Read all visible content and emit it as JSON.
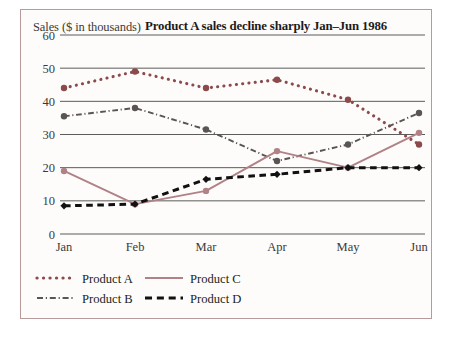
{
  "figure": {
    "yaxis_title": "Sales ($ in thousands)",
    "title": "Product A sales decline sharply Jan–Jun 1986"
  },
  "chart_data": {
    "type": "line",
    "title": "Product A sales decline sharply Jan–Jun 1986",
    "xlabel": "",
    "ylabel": "Sales ($ in thousands)",
    "categories": [
      "Jan",
      "Feb",
      "Mar",
      "Apr",
      "May",
      "Jun"
    ],
    "ylim": [
      0,
      60
    ],
    "yticks": [
      0,
      10,
      20,
      30,
      40,
      50,
      60
    ],
    "ytick_labels": [
      "0",
      "10",
      "20",
      "30",
      "40",
      "50",
      "60"
    ],
    "grid": "horizontal",
    "legend_position": "below-left",
    "series": [
      {
        "name": "Product A",
        "values": [
          44,
          49,
          44,
          46.5,
          40.5,
          27
        ],
        "color": "#8c4a4a",
        "style": "dotted",
        "marker": "circle"
      },
      {
        "name": "Product B",
        "values": [
          35.5,
          38,
          31.5,
          22,
          27,
          36.5
        ],
        "color": "#5a5452",
        "style": "dash-dot",
        "marker": "circle"
      },
      {
        "name": "Product C",
        "values": [
          19,
          9,
          13,
          25,
          20,
          30.5
        ],
        "color": "#b08286",
        "style": "solid",
        "marker": "circle"
      },
      {
        "name": "Product D",
        "values": [
          8.5,
          9,
          16.5,
          18,
          20,
          20
        ],
        "color": "#111111",
        "style": "dashed",
        "marker": "diamond"
      }
    ]
  },
  "legend": {
    "items": [
      {
        "label": "Product A",
        "color": "#8c4a4a",
        "style": "dotted"
      },
      {
        "label": "Product C",
        "color": "#b08286",
        "style": "solid"
      },
      {
        "label": "Product B",
        "color": "#5a5452",
        "style": "dash-dot"
      },
      {
        "label": "Product D",
        "color": "#111111",
        "style": "dashed"
      }
    ]
  }
}
